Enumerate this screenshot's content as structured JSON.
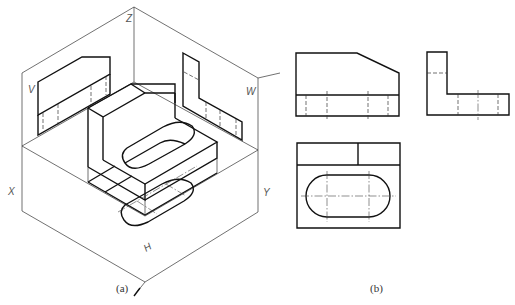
{
  "figure_a": {
    "caption": "(a)",
    "axis_labels": {
      "z": "Z",
      "x": "X",
      "y": "Y"
    },
    "plane_labels": {
      "v": "V",
      "w": "W",
      "h": "H"
    }
  },
  "figure_b": {
    "caption": "(b)",
    "views": [
      "front-view",
      "side-view",
      "top-view"
    ]
  }
}
